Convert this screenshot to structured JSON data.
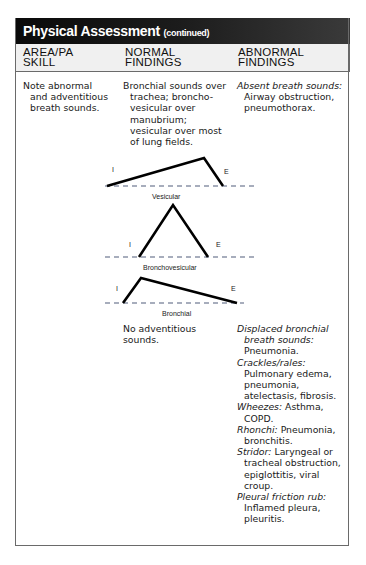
{
  "title": {
    "main": "Physical Assessment",
    "sub": "(continued)"
  },
  "columns": [
    {
      "label": "AREA/PA\nSKILL"
    },
    {
      "label": "NORMAL\nFINDINGS"
    },
    {
      "label": "ABNORMAL\nFINDINGS"
    }
  ],
  "rows": [
    {
      "area": "Note abnormal and adventitious breath sounds.",
      "normal": "Bronchial sounds over trachea; broncho-vesicular over manubrium; vesicular over most of lung fields.",
      "abnormal": [
        {
          "term": "Absent breath sounds:",
          "desc": "Airway obstruction, pneumothorax."
        }
      ]
    },
    {
      "normal": "No adventitious sounds.",
      "abnormal": [
        {
          "term": "Displaced bronchial breath sounds:",
          "desc": "Pneumonia."
        },
        {
          "term": "Crackles/rales:",
          "desc": "Pulmonary edema, pneumonia, atelectasis, fibrosis."
        },
        {
          "term": "Wheezes:",
          "desc": "Asthma, COPD."
        },
        {
          "term": "Rhonchi:",
          "desc": "Pneumonia, bronchitis."
        },
        {
          "term": "Stridor:",
          "desc": "Laryngeal or tracheal obstruction, epiglottitis, viral croup."
        },
        {
          "term": "Pleural friction rub:",
          "desc": "Inflamed pleura, pleuritis."
        }
      ]
    }
  ],
  "diagrams": [
    {
      "name": "Vesicular",
      "inspiration_label": "I",
      "expiration_label": "E"
    },
    {
      "name": "Bronchovesicular",
      "inspiration_label": "I",
      "expiration_label": "E"
    },
    {
      "name": "Bronchial",
      "inspiration_label": "I",
      "expiration_label": "E"
    }
  ],
  "colors": {
    "title_bar": "#0a0a0a",
    "header_bg": "#f0f0f0",
    "dashed_baseline": "#8a93a6",
    "waveform": "#000000"
  }
}
